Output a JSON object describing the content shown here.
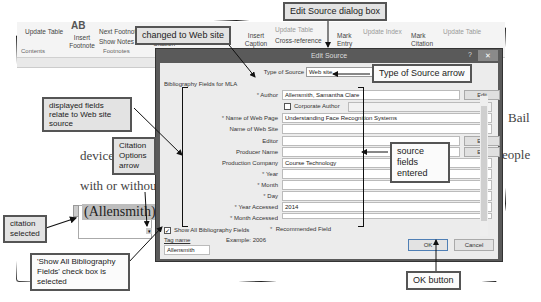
{
  "ribbon": {
    "update_table": "Update Table",
    "contents_group": "Contents",
    "insert_footnote_icon": "AB",
    "insert_footnote": "Insert Footnote",
    "next_footnote": "Next Footnote",
    "show_notes": "Show Notes",
    "footnotes_group": "Footnotes",
    "citation": "Citation",
    "insert_caption": "Insert Caption",
    "update_table_2": "Update Table",
    "cross_reference": "Cross-reference",
    "mark_entry": "Mark Entry",
    "update_index": "Update Index",
    "mark_citation": "Mark Citation",
    "update_table_3": "Update Table"
  },
  "document": {
    "text_device": "device",
    "text_with_or_without": "with or without",
    "text_bail": "Bail",
    "text_people": "eople",
    "citation": "(Allensmith)."
  },
  "dialog": {
    "title": "Edit Source",
    "help": "?",
    "close": "✕",
    "type_of_source_label": "Type of Source",
    "type_of_source_value": "Web site",
    "bibliography_fields_label": "Bibliography Fields for MLA",
    "fields": [
      {
        "label": "Author",
        "required": true,
        "value": "Allensmith, Samantha Clare",
        "edit": "Edit"
      },
      {
        "label": "Name of Web Page",
        "required": true,
        "value": "Understanding Face Recognition Systems"
      },
      {
        "label": "Name of Web Site",
        "required": false,
        "value": ""
      },
      {
        "label": "Editor",
        "required": false,
        "value": "",
        "edit": "Edit"
      },
      {
        "label": "Producer Name",
        "required": false,
        "value": "",
        "edit": "Edit"
      },
      {
        "label": "Production Company",
        "required": false,
        "value": "Course Technology"
      },
      {
        "label": "Year",
        "required": true,
        "value": ""
      },
      {
        "label": "Month",
        "required": true,
        "value": ""
      },
      {
        "label": "Day",
        "required": true,
        "value": ""
      },
      {
        "label": "Year Accessed",
        "required": true,
        "value": "2014"
      },
      {
        "label": "Month Accessed",
        "required": true,
        "value": ""
      }
    ],
    "corporate_author_label": "Corporate Author",
    "show_all_label": "Show All Bibliography Fields",
    "show_all_checked": true,
    "recommended_field": "Recommended Field",
    "tag_name_label": "Tag name",
    "tag_name_value": "Allensmith",
    "example": "Example: 2006",
    "ok": "OK",
    "cancel": "Cancel"
  },
  "callouts": {
    "changed_to_web_site": "changed to Web site",
    "edit_source_dialog_box": "Edit Source dialog box",
    "type_of_source_arrow": "Type of Source arrow",
    "displayed_fields": "displayed fields relate to Web site source",
    "citation_options_arrow": "Citation Options arrow",
    "source_fields_entered": "source fields entered",
    "citation_selected": "citation selected",
    "show_all_checkbox": "'Show All Bibliography Fields' check box is selected",
    "ok_button": "OK button"
  }
}
